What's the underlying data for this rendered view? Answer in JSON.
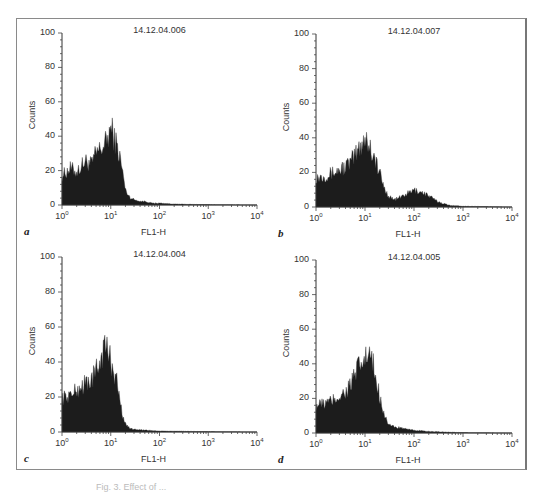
{
  "figure": {
    "caption_partial": "Fig. 3. Effect of ..."
  },
  "chart_data": [
    {
      "type": "area",
      "panel_letter": "a",
      "title": "14.12.04.006",
      "xlabel": "FL1-H",
      "ylabel": "Counts",
      "xscale": "log",
      "xlim": [
        1,
        10000
      ],
      "ylim": [
        0,
        100
      ],
      "yticks": [
        "0",
        "20",
        "40",
        "60",
        "80",
        "100"
      ],
      "xticks": [
        "10^0",
        "10^1",
        "10^2",
        "10^3",
        "10^4"
      ],
      "grid": false,
      "x": [
        1,
        1.5,
        2,
        3,
        4,
        5,
        6,
        7,
        8,
        9,
        10,
        12,
        14,
        16,
        18,
        20,
        25,
        30,
        40,
        50,
        70,
        100,
        200,
        500,
        1000,
        10000
      ],
      "values": [
        16,
        20,
        18,
        24,
        22,
        28,
        30,
        32,
        34,
        38,
        42,
        36,
        30,
        24,
        16,
        8,
        4,
        3,
        2,
        2,
        1,
        1,
        0.5,
        0.3,
        0.2,
        0
      ]
    },
    {
      "type": "area",
      "panel_letter": "b",
      "title": "14.12.04.007",
      "xlabel": "FL1-H",
      "ylabel": "Counts",
      "xscale": "log",
      "xlim": [
        1,
        10000
      ],
      "ylim": [
        0,
        100
      ],
      "yticks": [
        "0",
        "20",
        "40",
        "60",
        "80",
        "100"
      ],
      "xticks": [
        "10^0",
        "10^1",
        "10^2",
        "10^3",
        "10^4"
      ],
      "grid": false,
      "x": [
        1,
        1.5,
        2,
        3,
        4,
        5,
        6,
        7,
        8,
        9,
        10,
        12,
        14,
        16,
        20,
        25,
        30,
        40,
        50,
        70,
        100,
        150,
        200,
        300,
        500,
        1000,
        10000
      ],
      "values": [
        16,
        17,
        18,
        20,
        22,
        24,
        27,
        30,
        33,
        36,
        38,
        34,
        30,
        26,
        18,
        10,
        6,
        4,
        5,
        7,
        9,
        8,
        6,
        3,
        1,
        0.4,
        0
      ]
    },
    {
      "type": "area",
      "panel_letter": "c",
      "title": "14.12.04.004",
      "xlabel": "FL1-H",
      "ylabel": "Counts",
      "xscale": "log",
      "xlim": [
        1,
        10000
      ],
      "ylim": [
        0,
        100
      ],
      "yticks": [
        "0",
        "20",
        "40",
        "60",
        "80",
        "100"
      ],
      "xticks": [
        "10^0",
        "10^1",
        "10^2",
        "10^3",
        "10^4"
      ],
      "grid": false,
      "x": [
        1,
        1.5,
        2,
        3,
        4,
        5,
        6,
        7,
        8,
        9,
        10,
        12,
        14,
        16,
        18,
        20,
        25,
        30,
        50,
        100,
        1000,
        10000
      ],
      "values": [
        18,
        20,
        22,
        26,
        28,
        32,
        38,
        44,
        46,
        42,
        38,
        32,
        24,
        14,
        8,
        4,
        2,
        1.5,
        1,
        0.5,
        0.2,
        0
      ]
    },
    {
      "type": "area",
      "panel_letter": "d",
      "title": "14.12.04.005",
      "xlabel": "FL1-H",
      "ylabel": "Counts",
      "xscale": "log",
      "xlim": [
        1,
        10000
      ],
      "ylim": [
        0,
        100
      ],
      "yticks": [
        "0",
        "20",
        "40",
        "60",
        "80",
        "100"
      ],
      "xticks": [
        "10^0",
        "10^1",
        "10^2",
        "10^3",
        "10^4"
      ],
      "grid": false,
      "x": [
        1,
        1.5,
        2,
        3,
        4,
        5,
        6,
        7,
        8,
        10,
        12,
        14,
        16,
        20,
        25,
        30,
        40,
        50,
        70,
        100,
        200,
        1000,
        10000
      ],
      "values": [
        15,
        16,
        17,
        20,
        22,
        26,
        30,
        34,
        36,
        40,
        42,
        38,
        32,
        20,
        10,
        5,
        3,
        3,
        2,
        1.5,
        0.8,
        0.2,
        0
      ]
    }
  ]
}
